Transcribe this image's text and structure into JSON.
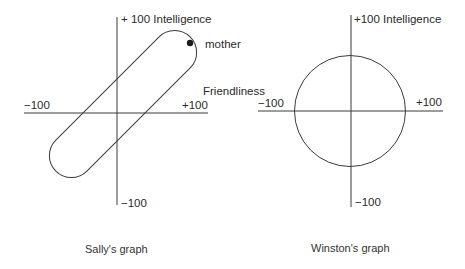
{
  "sally": {
    "y_top_label": "+ 100 Intelligence",
    "y_bottom_label": "−100",
    "x_left_label": "−100",
    "x_right_label": "+100",
    "point_label": "mother",
    "caption": "Sally's graph"
  },
  "shared": {
    "x_axis_name": "Friendliness"
  },
  "winston": {
    "y_top_label": "+100 Intelligence",
    "y_bottom_label": "−100",
    "x_left_label": "−100",
    "x_right_label": "+100",
    "caption": "Winston's graph"
  },
  "colors": {
    "line": "#3a3a3a",
    "text": "#2a2a2a"
  }
}
